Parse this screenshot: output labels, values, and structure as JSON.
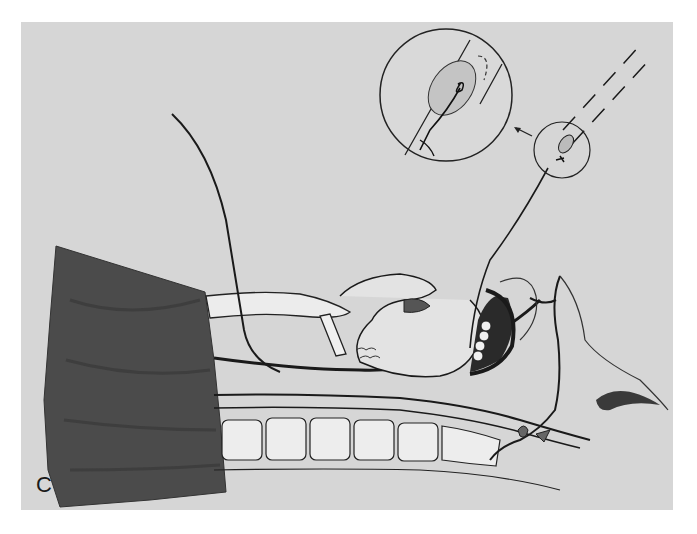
{
  "figure": {
    "panel_label": "C",
    "background_color": "#d6d6d6",
    "line_color": "#1a1a1a",
    "drape_color": "#4a4a4a",
    "components": [
      {
        "id": "surgical-drape",
        "description": "dark draped cloth covering body on left"
      },
      {
        "id": "neck-sagittal-section",
        "description": "sagittal section of neck with trachea, esophagus and vertebrae"
      },
      {
        "id": "tongue",
        "description": "tongue with larynx in sagittal view"
      },
      {
        "id": "mouth-teeth",
        "description": "open mouth with teeth and lips"
      },
      {
        "id": "nasal-cavity",
        "description": "nasal profile and nostril on right"
      },
      {
        "id": "guide-wire-left",
        "description": "wire emerging from neck upward to the left"
      },
      {
        "id": "guide-wire-right",
        "description": "wire exiting mouth up to tube tip"
      },
      {
        "id": "tube-dashed",
        "description": "dashed outline of tube at upper right"
      },
      {
        "id": "detail-circle-small",
        "description": "small circle around tube tip with knot"
      },
      {
        "id": "detail-circle-large",
        "description": "enlarged magnified view of tube tip and knot"
      },
      {
        "id": "magnify-arrow",
        "description": "arrow pointing from small circle to enlarged view"
      }
    ]
  }
}
